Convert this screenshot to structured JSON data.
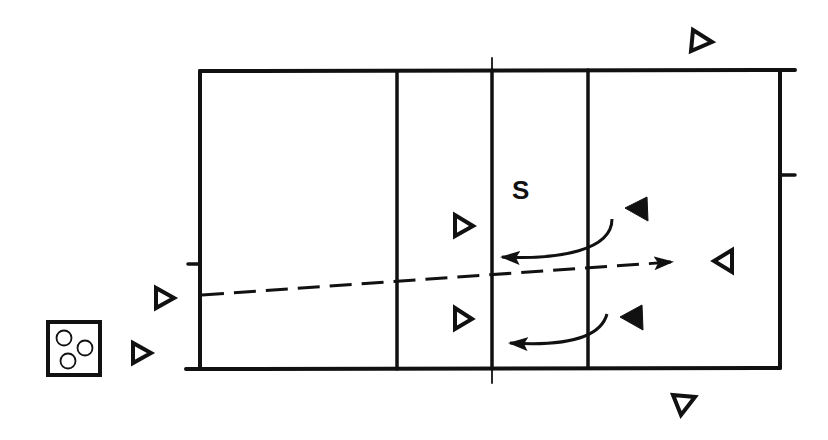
{
  "diagram": {
    "type": "volleyball-court-drill",
    "colors": {
      "line": "#111111",
      "background": "#ffffff"
    },
    "labels": {
      "setter": "S"
    },
    "court": {
      "outline": {
        "left": 200,
        "top": 71,
        "right": 780,
        "bottom": 369
      },
      "attack_lines_x": [
        397,
        588
      ],
      "net_x": 492
    },
    "players": {
      "team_open": [
        {
          "id": "left-back",
          "x": 163,
          "y": 298,
          "direction": "right"
        },
        {
          "id": "left-server",
          "x": 140,
          "y": 353,
          "direction": "right"
        },
        {
          "id": "front-upper",
          "x": 462,
          "y": 226,
          "direction": "right"
        },
        {
          "id": "front-lower",
          "x": 462,
          "y": 319,
          "direction": "right"
        },
        {
          "id": "top-right",
          "x": 703,
          "y": 42,
          "direction": "right"
        },
        {
          "id": "right-back",
          "x": 722,
          "y": 261,
          "direction": "left"
        },
        {
          "id": "bottom-right",
          "x": 683,
          "y": 404,
          "direction": "down"
        }
      ],
      "team_filled": [
        {
          "id": "blocker-upper",
          "x": 638,
          "y": 209,
          "direction": "left"
        },
        {
          "id": "blocker-lower",
          "x": 632,
          "y": 318,
          "direction": "left"
        }
      ]
    },
    "ball_cart": {
      "balls": 3
    },
    "paths": {
      "ball_trajectory": "dashed",
      "player_movements": 2
    }
  }
}
